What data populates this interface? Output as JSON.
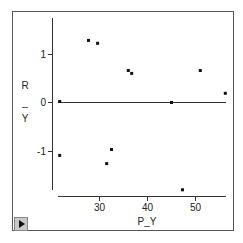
{
  "chart_data": {
    "type": "scatter",
    "title": "",
    "xlabel": "P_Y",
    "ylabel": "R_Y",
    "xlim": [
      20,
      57
    ],
    "ylim": [
      -1.9,
      1.6
    ],
    "x_ticks": [
      30,
      40,
      50
    ],
    "y_ticks": [
      -1,
      0,
      1
    ],
    "grid": false,
    "reference_line": {
      "y": 0,
      "x_from": 21,
      "x_to": 56
    },
    "points": [
      {
        "x": 21.7,
        "y": 0.02
      },
      {
        "x": 21.7,
        "y": -1.09
      },
      {
        "x": 27.7,
        "y": 1.28
      },
      {
        "x": 29.6,
        "y": 1.22
      },
      {
        "x": 31.5,
        "y": -1.26
      },
      {
        "x": 32.5,
        "y": -0.97
      },
      {
        "x": 36.0,
        "y": 0.66
      },
      {
        "x": 36.7,
        "y": 0.6
      },
      {
        "x": 45.0,
        "y": 0.0
      },
      {
        "x": 47.3,
        "y": -1.8
      },
      {
        "x": 51.0,
        "y": 0.66
      },
      {
        "x": 56.2,
        "y": 0.19
      }
    ]
  },
  "labels": {
    "x_axis_title": "P_Y",
    "y_axis_title_top": "R",
    "y_axis_title_mid": "_",
    "y_axis_title_bottom": "Y",
    "x_tick_30": "30",
    "x_tick_40": "40",
    "x_tick_50": "50",
    "y_tick_1": "1",
    "y_tick_0": "0",
    "y_tick_neg1": "-1"
  },
  "controls": {
    "play_button_label": "Play"
  }
}
